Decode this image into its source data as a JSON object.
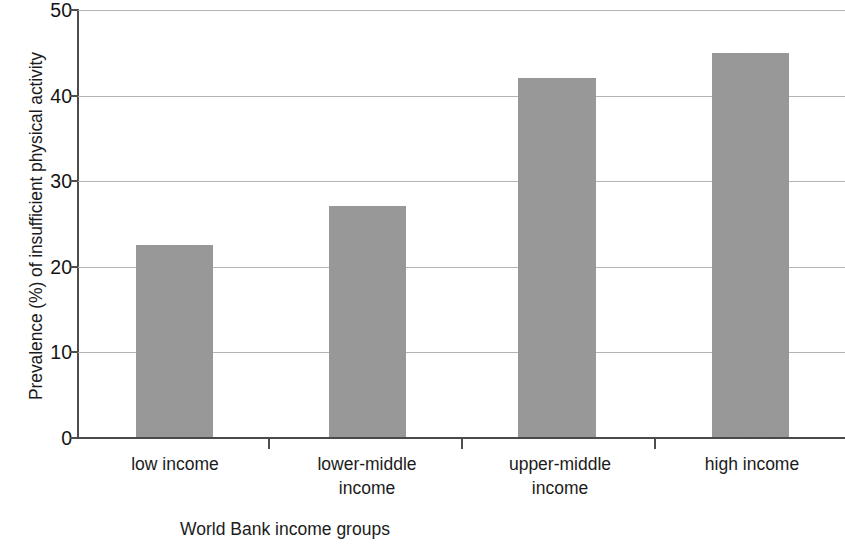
{
  "chart_data": {
    "type": "bar",
    "title": "",
    "subtitle": "",
    "xlabel": "World Bank income groups",
    "ylabel": "Prevalence (%) of insufficient physical activity",
    "categories": [
      "low income",
      "lower-middle income",
      "upper-middle income",
      "high income"
    ],
    "category_lines": [
      [
        "low income"
      ],
      [
        "lower-middle",
        "income"
      ],
      [
        "upper-middle",
        "income"
      ],
      [
        "high income"
      ]
    ],
    "values": [
      22.5,
      27.0,
      42.0,
      45.0
    ],
    "ylim": [
      0,
      50
    ],
    "ytick_labels": [
      "50",
      "40",
      "30",
      "20",
      "10",
      "0"
    ],
    "ytick_values": [
      50,
      40,
      30,
      20,
      10,
      0
    ],
    "grid": "horizontal",
    "legend": "none",
    "bar_color": "#9b9b9b",
    "gridline_color": "#b3b3b3",
    "axis_color": "#4d4d4d",
    "text_color": "#1b1b1b",
    "annotations": []
  }
}
